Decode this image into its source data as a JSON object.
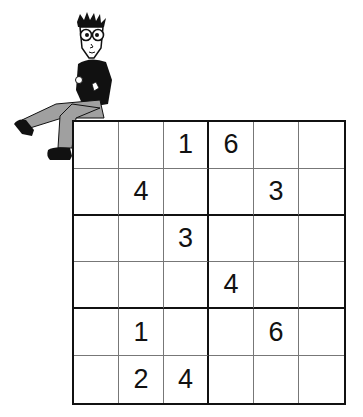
{
  "puzzle": {
    "type": "sudoku-6x6",
    "box_size": "2x3",
    "grid": [
      [
        "",
        "",
        "1",
        "6",
        "",
        ""
      ],
      [
        "",
        "4",
        "",
        "",
        "3",
        ""
      ],
      [
        "",
        "",
        "3",
        "",
        "",
        ""
      ],
      [
        "",
        "",
        "",
        "4",
        "",
        ""
      ],
      [
        "",
        "1",
        "",
        "",
        "6",
        ""
      ],
      [
        "",
        "2",
        "4",
        "",
        "",
        ""
      ]
    ]
  },
  "mascot": {
    "description": "cartoon man with glasses sitting on grid corner"
  },
  "colors": {
    "line": "#111111",
    "thin_line": "#777777",
    "background": "#ffffff",
    "digits": "#111111",
    "pants": "#a0a0a0"
  }
}
